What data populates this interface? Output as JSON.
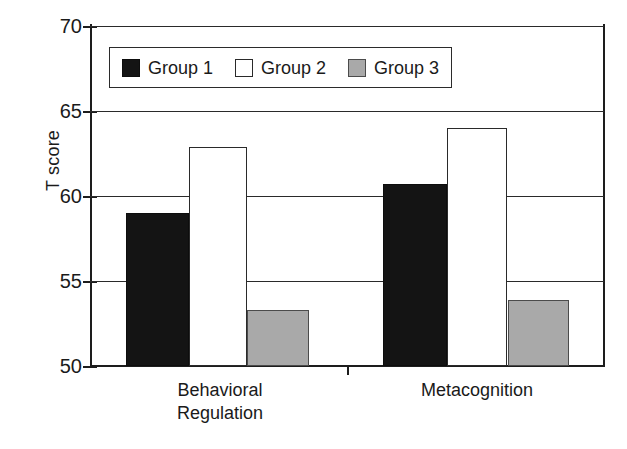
{
  "chart_data": {
    "type": "bar",
    "title": "",
    "subtitle": "",
    "xlabel": "",
    "ylabel": "T score",
    "ylim": [
      50,
      70
    ],
    "ytick_values": [
      50,
      55,
      60,
      65,
      70
    ],
    "ytick_labels": [
      "50",
      "55",
      "60",
      "65",
      "70"
    ],
    "grid": "horizontal",
    "legend_position": "upper-left-inside",
    "categories": [
      "Behavioral\nRegulation",
      "Metacognition"
    ],
    "series": [
      {
        "name": "Group 1",
        "color": "#141414",
        "fill": "black",
        "values": [
          59.0,
          60.7
        ]
      },
      {
        "name": "Group 2",
        "color": "#ffffff",
        "fill": "white",
        "values": [
          62.9,
          64.0
        ]
      },
      {
        "name": "Group 3",
        "color": "#a9a9a9",
        "fill": "gray",
        "values": [
          53.3,
          53.9
        ]
      }
    ],
    "annotations": []
  },
  "axis": {
    "ylabel": "T score",
    "ticks": [
      {
        "label": "70",
        "value": 70
      },
      {
        "label": "65",
        "value": 65
      },
      {
        "label": "60",
        "value": 60
      },
      {
        "label": "55",
        "value": 55
      },
      {
        "label": "50",
        "value": 50
      }
    ]
  },
  "legend": {
    "entries": [
      {
        "label": "Group 1",
        "fill": "black"
      },
      {
        "label": "Group 2",
        "fill": "white"
      },
      {
        "label": "Group 3",
        "fill": "gray"
      }
    ]
  },
  "categories": [
    {
      "label": "Behavioral\nRegulation"
    },
    {
      "label": "Metacognition"
    }
  ]
}
